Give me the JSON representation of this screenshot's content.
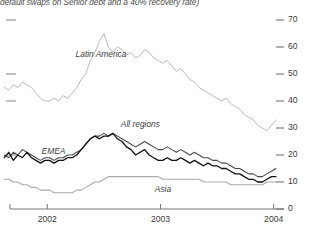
{
  "caption": "default swaps on Senior debt and a 40% recovery rate)",
  "chart_data": {
    "type": "line",
    "title": "default swaps on Senior debt and a 40% recovery rate)",
    "xlabel": "",
    "ylabel": "",
    "ylim": [
      0,
      70
    ],
    "xlim": [
      2001.6,
      2004.1
    ],
    "grid": false,
    "legend_position": "inline-annotations",
    "y_axis_side": "right",
    "yticks": [
      0,
      10,
      20,
      30,
      40,
      50,
      60,
      70
    ],
    "ytick_labels": [
      "0",
      "10",
      "20",
      "30",
      "40",
      "50",
      "60",
      "70"
    ],
    "xticks": [
      2002,
      2003,
      2004
    ],
    "xtick_labels": [
      "2002",
      "2003",
      "2004"
    ],
    "annotations": [
      {
        "text": "Latin America",
        "x": 2002.25,
        "y": 57
      },
      {
        "text": "All regions",
        "x": 2002.65,
        "y": 31
      },
      {
        "text": "EMEA",
        "x": 2001.95,
        "y": 21
      },
      {
        "text": "Asia",
        "x": 2002.95,
        "y": 7
      }
    ],
    "series": [
      {
        "name": "Latin America",
        "color": "#b9b9b9",
        "width": 1.0,
        "x": [
          2001.62,
          2001.66,
          2001.7,
          2001.74,
          2001.78,
          2001.82,
          2001.86,
          2001.9,
          2001.94,
          2001.98,
          2002.02,
          2002.06,
          2002.1,
          2002.14,
          2002.18,
          2002.22,
          2002.26,
          2002.3,
          2002.34,
          2002.38,
          2002.42,
          2002.46,
          2002.5,
          2002.54,
          2002.58,
          2002.62,
          2002.66,
          2002.7,
          2002.74,
          2002.78,
          2002.82,
          2002.86,
          2002.9,
          2002.94,
          2002.98,
          2003.02,
          2003.06,
          2003.1,
          2003.14,
          2003.18,
          2003.22,
          2003.26,
          2003.3,
          2003.34,
          2003.38,
          2003.42,
          2003.46,
          2003.5,
          2003.54,
          2003.58,
          2003.62,
          2003.66,
          2003.7,
          2003.74,
          2003.78,
          2003.82,
          2003.86,
          2003.9,
          2003.94,
          2003.98,
          2004.02
        ],
        "y": [
          45,
          44,
          46,
          45,
          47,
          46,
          45,
          43,
          41,
          40,
          40,
          41,
          40,
          42,
          41,
          43,
          45,
          48,
          50,
          55,
          58,
          62,
          65,
          60,
          58,
          60,
          59,
          57,
          58,
          56,
          57,
          59,
          58,
          56,
          55,
          54,
          55,
          53,
          51,
          52,
          50,
          48,
          47,
          45,
          44,
          43,
          42,
          41,
          40,
          41,
          39,
          38,
          37,
          35,
          34,
          33,
          31,
          30,
          29,
          31,
          33
        ]
      },
      {
        "name": "All regions",
        "color": "#4a4a4a",
        "width": 1.1,
        "x": [
          2001.62,
          2001.66,
          2001.7,
          2001.74,
          2001.78,
          2001.82,
          2001.86,
          2001.9,
          2001.94,
          2001.98,
          2002.02,
          2002.06,
          2002.1,
          2002.14,
          2002.18,
          2002.22,
          2002.26,
          2002.3,
          2002.34,
          2002.38,
          2002.42,
          2002.46,
          2002.5,
          2002.54,
          2002.58,
          2002.62,
          2002.66,
          2002.7,
          2002.74,
          2002.78,
          2002.82,
          2002.86,
          2002.9,
          2002.94,
          2002.98,
          2003.02,
          2003.06,
          2003.1,
          2003.14,
          2003.18,
          2003.22,
          2003.26,
          2003.3,
          2003.34,
          2003.38,
          2003.42,
          2003.46,
          2003.5,
          2003.54,
          2003.58,
          2003.62,
          2003.66,
          2003.7,
          2003.74,
          2003.78,
          2003.82,
          2003.86,
          2003.9,
          2003.94,
          2003.98,
          2004.02
        ],
        "y": [
          20,
          19,
          21,
          20,
          22,
          21,
          20,
          19,
          18,
          19,
          19,
          18,
          19,
          19,
          20,
          20,
          21,
          22,
          24,
          26,
          27,
          27,
          28,
          27,
          28,
          27,
          26,
          25,
          24,
          23,
          24,
          25,
          24,
          23,
          22,
          22,
          23,
          22,
          21,
          22,
          21,
          20,
          21,
          20,
          19,
          19,
          18,
          18,
          17,
          17,
          16,
          15,
          15,
          14,
          13,
          13,
          12,
          12,
          13,
          14,
          15
        ]
      },
      {
        "name": "EMEA",
        "color": "#111111",
        "width": 1.3,
        "x": [
          2001.62,
          2001.66,
          2001.7,
          2001.74,
          2001.78,
          2001.82,
          2001.86,
          2001.9,
          2001.94,
          2001.98,
          2002.02,
          2002.06,
          2002.1,
          2002.14,
          2002.18,
          2002.22,
          2002.26,
          2002.3,
          2002.34,
          2002.38,
          2002.42,
          2002.46,
          2002.5,
          2002.54,
          2002.58,
          2002.62,
          2002.66,
          2002.7,
          2002.74,
          2002.78,
          2002.82,
          2002.86,
          2002.9,
          2002.94,
          2002.98,
          2003.02,
          2003.06,
          2003.1,
          2003.14,
          2003.18,
          2003.22,
          2003.26,
          2003.3,
          2003.34,
          2003.38,
          2003.42,
          2003.46,
          2003.5,
          2003.54,
          2003.58,
          2003.62,
          2003.66,
          2003.7,
          2003.74,
          2003.78,
          2003.82,
          2003.86,
          2003.9,
          2003.94,
          2003.98,
          2004.02
        ],
        "y": [
          19,
          21,
          18,
          20,
          19,
          21,
          19,
          18,
          17,
          18,
          18,
          17,
          18,
          18,
          19,
          19,
          20,
          22,
          24,
          26,
          27,
          26,
          27,
          27,
          28,
          26,
          25,
          23,
          22,
          20,
          21,
          22,
          20,
          19,
          18,
          18,
          19,
          18,
          18,
          19,
          18,
          17,
          18,
          17,
          16,
          17,
          16,
          16,
          15,
          15,
          14,
          13,
          13,
          12,
          11,
          11,
          10,
          10,
          11,
          12,
          12
        ]
      },
      {
        "name": "Asia",
        "color": "#a9a9a9",
        "width": 1.1,
        "x": [
          2001.62,
          2001.66,
          2001.7,
          2001.74,
          2001.78,
          2001.82,
          2001.86,
          2001.9,
          2001.94,
          2001.98,
          2002.02,
          2002.06,
          2002.1,
          2002.14,
          2002.18,
          2002.22,
          2002.26,
          2002.3,
          2002.34,
          2002.38,
          2002.42,
          2002.46,
          2002.5,
          2002.54,
          2002.58,
          2002.62,
          2002.66,
          2002.7,
          2002.74,
          2002.78,
          2002.82,
          2002.86,
          2002.9,
          2002.94,
          2002.98,
          2003.02,
          2003.06,
          2003.1,
          2003.14,
          2003.18,
          2003.22,
          2003.26,
          2003.3,
          2003.34,
          2003.38,
          2003.42,
          2003.46,
          2003.5,
          2003.54,
          2003.58,
          2003.62,
          2003.66,
          2003.7,
          2003.74,
          2003.78,
          2003.82,
          2003.86,
          2003.9,
          2003.94,
          2003.98,
          2004.02
        ],
        "y": [
          11,
          11,
          10,
          10,
          9,
          9,
          8,
          8,
          7,
          7,
          7,
          6,
          6,
          6,
          6,
          6,
          7,
          7,
          8,
          9,
          10,
          10,
          11,
          12,
          12,
          12,
          12,
          12,
          12,
          12,
          12,
          12,
          12,
          12,
          12,
          11,
          11,
          11,
          11,
          11,
          11,
          11,
          11,
          11,
          10,
          10,
          10,
          10,
          10,
          10,
          9,
          9,
          9,
          9,
          9,
          9,
          9,
          9,
          10,
          10,
          10
        ]
      }
    ]
  }
}
